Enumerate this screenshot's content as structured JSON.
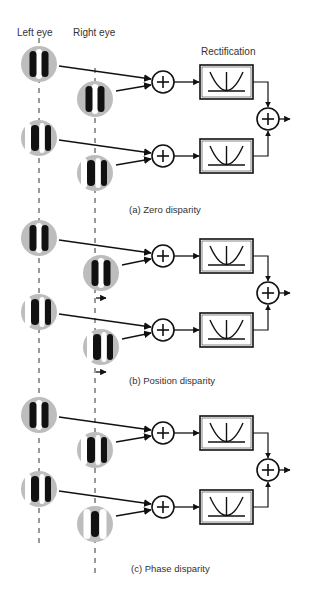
{
  "headers": {
    "left_eye": "Left eye",
    "right_eye": "Right eye",
    "rectification": "Rectification"
  },
  "panels": [
    {
      "id": "a",
      "caption": "(a) Zero disparity",
      "rows": [
        {
          "left": "even",
          "right": "even"
        },
        {
          "left": "odd",
          "right": "odd"
        }
      ],
      "shift_markers": false
    },
    {
      "id": "b",
      "caption": "(b) Position disparity",
      "rows": [
        {
          "left": "even",
          "right": "even"
        },
        {
          "left": "odd",
          "right": "odd"
        }
      ],
      "shift_markers": true
    },
    {
      "id": "c",
      "caption": "(c) Phase disparity",
      "rows": [
        {
          "left": "even",
          "right": "odd"
        },
        {
          "left": "odd",
          "right": "even-center"
        }
      ],
      "shift_markers": false
    }
  ],
  "symbols": {
    "sum": "+"
  }
}
